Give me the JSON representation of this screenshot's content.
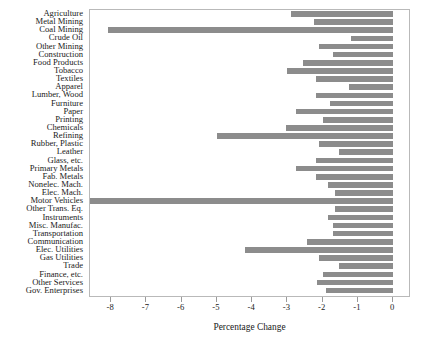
{
  "chart_data": {
    "type": "bar",
    "orientation": "horizontal",
    "title": "",
    "xlabel": "Percentage Change",
    "ylabel": "",
    "xlim": [
      -8.6,
      0.45
    ],
    "xticks": [
      -8,
      -7,
      -6,
      -5,
      -4,
      -3,
      -2,
      -1,
      0
    ],
    "xticklabels": [
      "-8",
      "-7",
      "-6",
      "-5",
      "-4",
      "-3",
      "-2",
      "-1",
      "0"
    ],
    "grid": false,
    "legend": null,
    "bar_color": "#8c8c8c",
    "categories": [
      "Agriculture",
      "Metal Mining",
      "Coal Mining",
      "Crude Oil",
      "Other Mining",
      "Construction",
      "Food Products",
      "Tobacco",
      "Textiles",
      "Apparel",
      "Lumber, Wood",
      "Furniture",
      "Paper",
      "Printing",
      "Chemicals",
      "Refining",
      "Rubber, Plastic",
      "Leather",
      "Glass, etc.",
      "Primary Metals",
      "Fab. Metals",
      "Nonelec. Mach.",
      "Elec. Mach.",
      "Motor Vehicles",
      "Other Trans. Eq.",
      "Instruments",
      "Misc. Manufac.",
      "Transportation",
      "Communication",
      "Elec. Utilities",
      "Gas Utilities",
      "Trade",
      "Finance, etc.",
      "Other Services",
      "Gov. Enterprises"
    ],
    "values": [
      -2.9,
      -2.25,
      -8.1,
      -1.2,
      -2.1,
      -1.7,
      -2.55,
      -3.0,
      -2.2,
      -1.25,
      -2.2,
      -1.8,
      -2.75,
      -2.0,
      -3.05,
      -5.0,
      -2.1,
      -1.55,
      -2.2,
      -2.75,
      -2.2,
      -1.85,
      -1.65,
      -9.3,
      -1.65,
      -1.85,
      -1.7,
      -1.7,
      -2.45,
      -4.2,
      -2.1,
      -1.55,
      -2.0,
      -2.15,
      -1.9
    ]
  }
}
